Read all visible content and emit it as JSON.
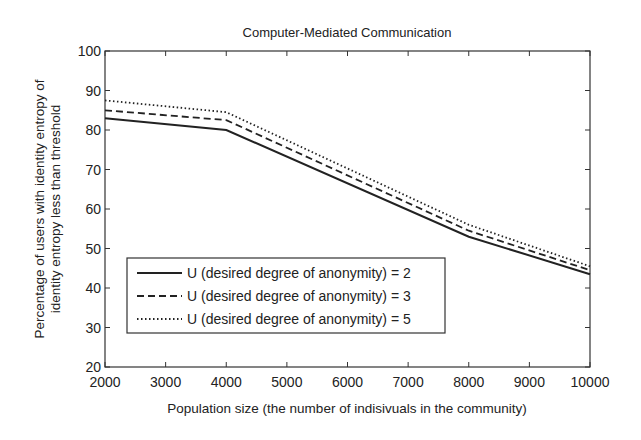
{
  "chart_data": {
    "type": "line",
    "title": "Computer-Mediated Communication",
    "xlabel": "Population size (the number of indisivuals in the community)",
    "ylabel_line1": "Percentage of users with identity entropy of",
    "ylabel_line2": "identity entropy less than threshold",
    "x": [
      2000,
      4000,
      8000,
      10000
    ],
    "xlim": [
      2000,
      10000
    ],
    "ylim": [
      20,
      100
    ],
    "xticks": [
      2000,
      3000,
      4000,
      5000,
      6000,
      7000,
      8000,
      9000,
      10000
    ],
    "yticks": [
      20,
      30,
      40,
      50,
      60,
      70,
      80,
      90,
      100
    ],
    "grid": false,
    "legend_position": "lower left",
    "series": [
      {
        "name": "U (desired degree of anonymity) = 2",
        "style": "solid",
        "values": [
          83,
          80,
          53,
          43.5
        ]
      },
      {
        "name": "U (desired degree of anonymity) = 3",
        "style": "dashed",
        "values": [
          85,
          82.5,
          54.5,
          44.5
        ]
      },
      {
        "name": "U (desired degree of anonymity) = 5",
        "style": "dotted",
        "values": [
          87.5,
          84.5,
          56,
          45.5
        ]
      }
    ]
  },
  "colors": {
    "line": "#222222",
    "axis": "#333333",
    "background": "#ffffff"
  }
}
